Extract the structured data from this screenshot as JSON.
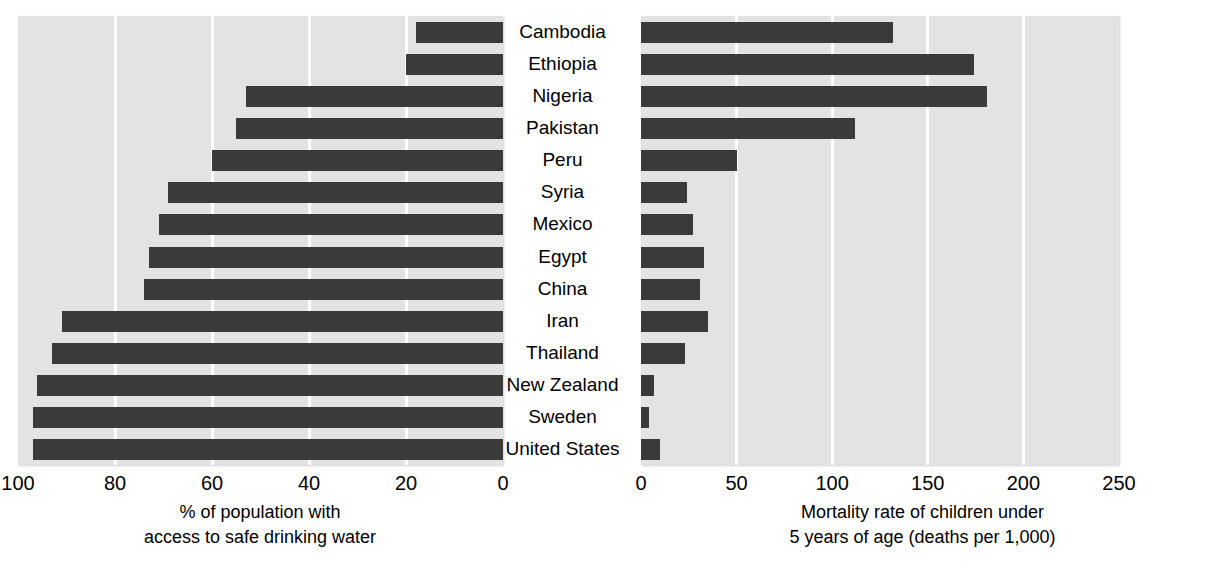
{
  "chart_data": {
    "type": "bar",
    "orientation": "horizontal",
    "title": "",
    "categories": [
      "Cambodia",
      "Ethiopia",
      "Nigeria",
      "Pakistan",
      "Peru",
      "Syria",
      "Mexico",
      "Egypt",
      "China",
      "Iran",
      "Thailand",
      "New Zealand",
      "Sweden",
      "United States"
    ],
    "panels": [
      {
        "id": "water-access",
        "xlabel_lines": [
          "% of population with",
          "access to safe drinking water"
        ],
        "ylabel": "",
        "xlim": [
          100,
          0
        ],
        "reversed": true,
        "ticks": [
          100,
          80,
          60,
          40,
          20,
          0
        ],
        "tick_labels": [
          "100",
          "80",
          "60",
          "40",
          "20",
          "0"
        ],
        "grid": true,
        "values": [
          18,
          20,
          53,
          55,
          60,
          69,
          71,
          73,
          74,
          91,
          93,
          96,
          97,
          97
        ],
        "bar_color": "#3a3a3a",
        "plot_bg": "#e3e3e3"
      },
      {
        "id": "child-mortality",
        "xlabel_lines": [
          "Mortality rate of children under",
          "5 years of age (deaths per 1,000)"
        ],
        "ylabel": "",
        "xlim": [
          0,
          250
        ],
        "reversed": false,
        "ticks": [
          0,
          50,
          100,
          150,
          200,
          250
        ],
        "tick_labels": [
          "0",
          "50",
          "100",
          "150",
          "200",
          "250"
        ],
        "grid": true,
        "values": [
          132,
          174,
          181,
          112,
          50,
          24,
          27,
          33,
          31,
          35,
          23,
          7,
          4,
          10
        ],
        "bar_color": "#3a3a3a",
        "plot_bg": "#e3e3e3"
      }
    ]
  }
}
